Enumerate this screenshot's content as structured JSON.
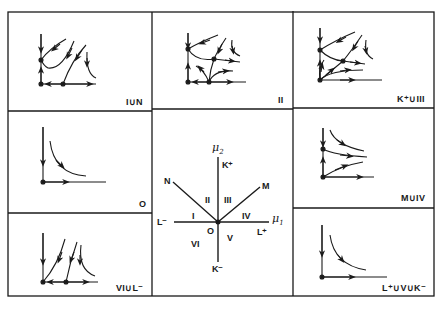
{
  "figure": {
    "ink_color": "#1a1a1a",
    "background": "#ffffff"
  },
  "panels": [
    {
      "id": "I_union_N",
      "label": "I∪N",
      "position": "top-left"
    },
    {
      "id": "II",
      "label": "II",
      "position": "top-center"
    },
    {
      "id": "K_plus_union_III",
      "label": "K⁺∪III",
      "position": "top-right"
    },
    {
      "id": "O",
      "label": "O",
      "position": "middle-left"
    },
    {
      "id": "M_union_IV",
      "label": "M∪IV",
      "position": "middle-right"
    },
    {
      "id": "VI_union_L_minus",
      "label": "VI∪L⁻",
      "position": "bottom-left"
    },
    {
      "id": "L_plus_union_V_union_K_minus",
      "label": "L⁺∪V∪K⁻",
      "position": "bottom-right"
    }
  ],
  "parameter_plane": {
    "axis_x_label": "μ",
    "axis_x_sub": "1",
    "axis_y_label": "μ",
    "axis_y_sub": "2",
    "origin_label": "O",
    "ray_labels": {
      "K_plus": "K⁺",
      "K_minus": "K⁻",
      "L_plus": "L⁺",
      "L_minus": "L⁻",
      "M": "M",
      "N": "N"
    },
    "region_labels": {
      "I": "I",
      "II": "II",
      "III": "III",
      "IV": "IV",
      "V": "V",
      "VI": "VI"
    }
  }
}
